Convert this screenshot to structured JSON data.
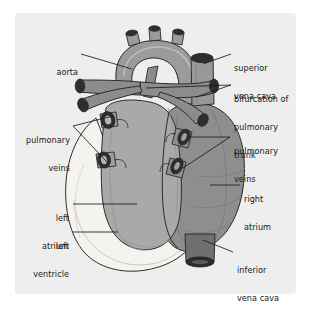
{
  "figure": {
    "type": "anatomical-diagram",
    "panel_background": "#eeeeee",
    "page_background": "#ffffff"
  },
  "palette": {
    "outline": "#2b2b2b",
    "left_ventricle": "#f2f1ec",
    "left_atrium": "#a8a8a8",
    "right_atrium": "#8f8f8f",
    "aortic_arch": "#9a9a9a",
    "pulmonary_trunk": "#8a8a8a",
    "vessel_lumen": "#2e2e2e",
    "inferior_vena_cava": "#6d6d6d",
    "leader_line": "#1a1a1a"
  },
  "labels": [
    {
      "id": "aorta",
      "text": "aorta",
      "align": "right",
      "lines": [
        "aorta"
      ]
    },
    {
      "id": "superior-vena-cava",
      "text": "superior vena cava",
      "align": "left",
      "lines": [
        "superior",
        "vena cava"
      ]
    },
    {
      "id": "bifurcation-pulmonary-trunk",
      "text": "bifurcation of pulmonary trunk",
      "align": "left",
      "lines": [
        "bifurcation of",
        "pulmonary",
        "trunk"
      ]
    },
    {
      "id": "pulmonary-veins-left",
      "text": "pulmonary veins",
      "align": "right",
      "lines": [
        "pulmonary",
        "veins"
      ]
    },
    {
      "id": "pulmonary-veins-right",
      "text": "pulmonary veins",
      "align": "left",
      "lines": [
        "pulmonary",
        "veins"
      ]
    },
    {
      "id": "right-atrium",
      "text": "right atrium",
      "align": "left",
      "lines": [
        "right",
        "atrium"
      ]
    },
    {
      "id": "left-atrium",
      "text": "left atrium",
      "align": "right",
      "lines": [
        "left",
        "atrium"
      ]
    },
    {
      "id": "left-ventricle",
      "text": "left ventricle",
      "align": "right",
      "lines": [
        "left",
        "ventricle"
      ]
    },
    {
      "id": "inferior-vena-cava",
      "text": "inferior vena cava",
      "align": "left",
      "lines": [
        "inferior",
        "vena cava"
      ]
    }
  ],
  "label_text": {
    "aorta_l1": "aorta",
    "svc_l1": "superior",
    "svc_l2": "vena cava",
    "bif_l1": "bifurcation of",
    "bif_l2": "pulmonary",
    "bif_l3": "trunk",
    "pvl_l1": "pulmonary",
    "pvl_l2": "veins",
    "pvr_l1": "pulmonary",
    "pvr_l2": "veins",
    "ra_l1": "right",
    "ra_l2": "atrium",
    "la_l1": "left",
    "la_l2": "atrium",
    "lv_l1": "left",
    "lv_l2": "ventricle",
    "ivc_l1": "inferior",
    "ivc_l2": "vena cava"
  },
  "structures": [
    {
      "id": "aortic-arch",
      "name": "aorta"
    },
    {
      "id": "brachiocephalic-branches",
      "name": "aortic arch branches",
      "count": 3
    },
    {
      "id": "superior-vena-cava-vessel",
      "name": "superior vena cava"
    },
    {
      "id": "pulmonary-trunk-vessel",
      "name": "pulmonary trunk bifurcation"
    },
    {
      "id": "left-pulmonary-artery",
      "name": "left pulmonary artery"
    },
    {
      "id": "right-pulmonary-artery",
      "name": "right pulmonary artery"
    },
    {
      "id": "pulmonary-vein-left-upper",
      "name": "left superior pulmonary vein"
    },
    {
      "id": "pulmonary-vein-left-lower",
      "name": "left inferior pulmonary vein"
    },
    {
      "id": "pulmonary-vein-right-upper",
      "name": "right superior pulmonary vein"
    },
    {
      "id": "pulmonary-vein-right-lower",
      "name": "right inferior pulmonary vein"
    },
    {
      "id": "left-atrium-body",
      "name": "left atrium"
    },
    {
      "id": "right-atrium-body",
      "name": "right atrium"
    },
    {
      "id": "left-ventricle-body",
      "name": "left ventricle"
    },
    {
      "id": "inferior-vena-cava-vessel",
      "name": "inferior vena cava"
    }
  ]
}
